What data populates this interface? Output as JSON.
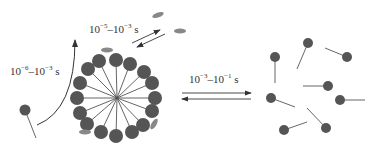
{
  "diagram": {
    "type": "micelle-exchange-kinetics",
    "colors": {
      "head": "#555555",
      "tail": "#555555",
      "solubilizate": "#888888",
      "arrow": "#333333",
      "text": "#333333"
    },
    "labels": {
      "monomer_exchange": {
        "base1": "10",
        "exp1": "−6",
        "dash": "–",
        "base2": "10",
        "exp2": "−3",
        "unit": " s"
      },
      "solubilizate_exchange": {
        "base1": "10",
        "exp1": "−5",
        "dash": "–",
        "base2": "10",
        "exp2": "−3",
        "unit": " s"
      },
      "micelle_dissolution": {
        "base1": "10",
        "exp1": "−3",
        "dash": "–",
        "base2": "10",
        "exp2": "−1",
        "unit": " s"
      }
    },
    "micelle": {
      "center": [
        117,
        98
      ],
      "head_radius": 7,
      "heads": [
        [
          116,
          60
        ],
        [
          99,
          61
        ],
        [
          130,
          64
        ],
        [
          88,
          69
        ],
        [
          144,
          72
        ],
        [
          152,
          83
        ],
        [
          80,
          83
        ],
        [
          77,
          98
        ],
        [
          155,
          98
        ],
        [
          80,
          113
        ],
        [
          152,
          111
        ],
        [
          87,
          124
        ],
        [
          143,
          125
        ],
        [
          101,
          132
        ],
        [
          132,
          132
        ],
        [
          116,
          136
        ]
      ]
    },
    "free_monomer": {
      "head": [
        25,
        110
      ],
      "tail_end": [
        36,
        138
      ]
    },
    "solubilizates": [
      {
        "cx": 158,
        "cy": 15,
        "rx": 6,
        "ry": 2.5,
        "rot": -20
      },
      {
        "cx": 180,
        "cy": 31,
        "rx": 6,
        "ry": 2.5,
        "rot": 0
      },
      {
        "cx": 107,
        "cy": 50,
        "rx": 6,
        "ry": 2.5,
        "rot": 0
      },
      {
        "cx": 154,
        "cy": 124,
        "rx": 6,
        "ry": 2.5,
        "rot": -60
      },
      {
        "cx": 85,
        "cy": 132,
        "rx": 6,
        "ry": 2.5,
        "rot": 0
      }
    ],
    "dispersed_monomers": [
      {
        "head": [
          275,
          57
        ],
        "tail_end": [
          275,
          83
        ]
      },
      {
        "head": [
          308,
          43
        ],
        "tail_end": [
          297,
          69
        ]
      },
      {
        "head": [
          347,
          57
        ],
        "tail_end": [
          325,
          48
        ]
      },
      {
        "head": [
          328,
          86
        ],
        "tail_end": [
          303,
          86
        ]
      },
      {
        "head": [
          271,
          98
        ],
        "tail_end": [
          295,
          107
        ]
      },
      {
        "head": [
          340,
          100
        ],
        "tail_end": [
          365,
          100
        ]
      },
      {
        "head": [
          284,
          130
        ],
        "tail_end": [
          307,
          122
        ]
      },
      {
        "head": [
          326,
          128
        ],
        "tail_end": [
          307,
          108
        ]
      }
    ]
  }
}
